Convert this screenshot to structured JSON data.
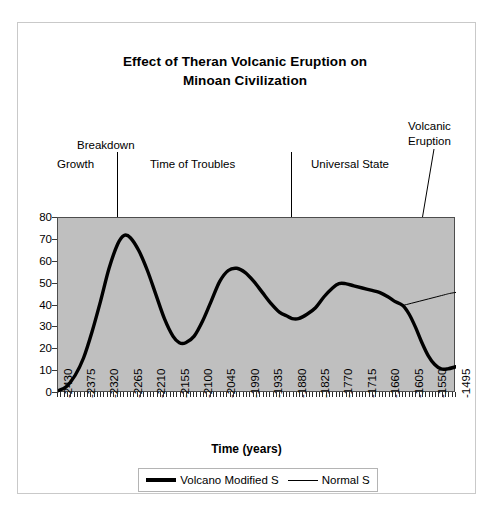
{
  "chart_data": {
    "type": "line",
    "title": "Effect of Theran Volcanic Eruption on Minoan Civilization",
    "title_line1": "Effect of Theran Volcanic Eruption on",
    "title_line2": "Minoan Civilization",
    "xlabel": "Time (years)",
    "ylabel": "",
    "xlim": [
      -2430,
      -1495
    ],
    "ylim": [
      0,
      80
    ],
    "grid": false,
    "plot_background": "#bfbfbf",
    "legend_position": "bottom",
    "x_ticklabels": [
      "-2430",
      "-2375",
      "-2320",
      "-2265",
      "-2210",
      "-2155",
      "-2100",
      "-2045",
      "-1990",
      "-1935",
      "-1880",
      "-1825",
      "-1770",
      "-1715",
      "-1660",
      "-1605",
      "-1550",
      "-1495"
    ],
    "y_ticklabels": [
      "0",
      "10",
      "20",
      "30",
      "40",
      "50",
      "60",
      "70",
      "80"
    ],
    "y_ticks": [
      0,
      10,
      20,
      30,
      40,
      50,
      60,
      70,
      80
    ],
    "series": [
      {
        "name": "Volcano Modified S",
        "style": "thick",
        "color": "#000000",
        "x": [
          -2430,
          -2410,
          -2390,
          -2370,
          -2350,
          -2330,
          -2310,
          -2290,
          -2275,
          -2260,
          -2240,
          -2220,
          -2200,
          -2180,
          -2160,
          -2145,
          -2130,
          -2110,
          -2090,
          -2070,
          -2050,
          -2030,
          -2010,
          -1990,
          -1970,
          -1950,
          -1930,
          -1910,
          -1890,
          -1880,
          -1865,
          -1845,
          -1825,
          -1805,
          -1785,
          -1770,
          -1755,
          -1735,
          -1715,
          -1695,
          -1675,
          -1655,
          -1640,
          -1620,
          -1605,
          -1590,
          -1575,
          -1560,
          -1545,
          -1530,
          -1515,
          -1495
        ],
        "y": [
          1,
          3,
          8,
          16,
          28,
          42,
          57,
          68,
          72,
          71,
          65,
          56,
          45,
          34,
          26,
          23,
          23,
          26,
          33,
          42,
          51,
          56,
          57,
          55,
          51,
          46,
          41,
          37,
          35,
          34,
          34,
          36,
          39,
          44,
          48,
          50,
          50,
          49,
          48,
          47,
          46,
          44,
          42,
          40,
          36,
          30,
          23,
          17,
          13,
          11,
          11,
          12
        ]
      },
      {
        "name": "Normal S",
        "style": "thin",
        "color": "#000000",
        "x": [
          -1620,
          -1600,
          -1580,
          -1560,
          -1540,
          -1520,
          -1510,
          -1495
        ],
        "y": [
          40,
          41,
          42,
          43,
          44,
          45,
          45.5,
          46
        ]
      }
    ],
    "annotations": [
      {
        "id": "growth",
        "text": "Growth",
        "type": "era-label"
      },
      {
        "id": "breakdown",
        "text": "Breakdown",
        "type": "era-label"
      },
      {
        "id": "troubles",
        "text": "Time of Troubles",
        "type": "era-label"
      },
      {
        "id": "universal",
        "text": "Universal State",
        "type": "era-label"
      },
      {
        "id": "volcanic",
        "text_line1": "Volcanic",
        "text_line2": "Eruption",
        "type": "callout-with-arrow",
        "points_to_x": -1620,
        "points_to_y": 40
      }
    ],
    "era_dividers": [
      {
        "label": "Breakdown",
        "x": -2290
      },
      {
        "label": "Universal State start",
        "x": -1880
      }
    ]
  },
  "legend": {
    "items": [
      {
        "label": "Volcano Modified S",
        "style": "thick"
      },
      {
        "label": "Normal S",
        "style": "thin"
      }
    ]
  }
}
